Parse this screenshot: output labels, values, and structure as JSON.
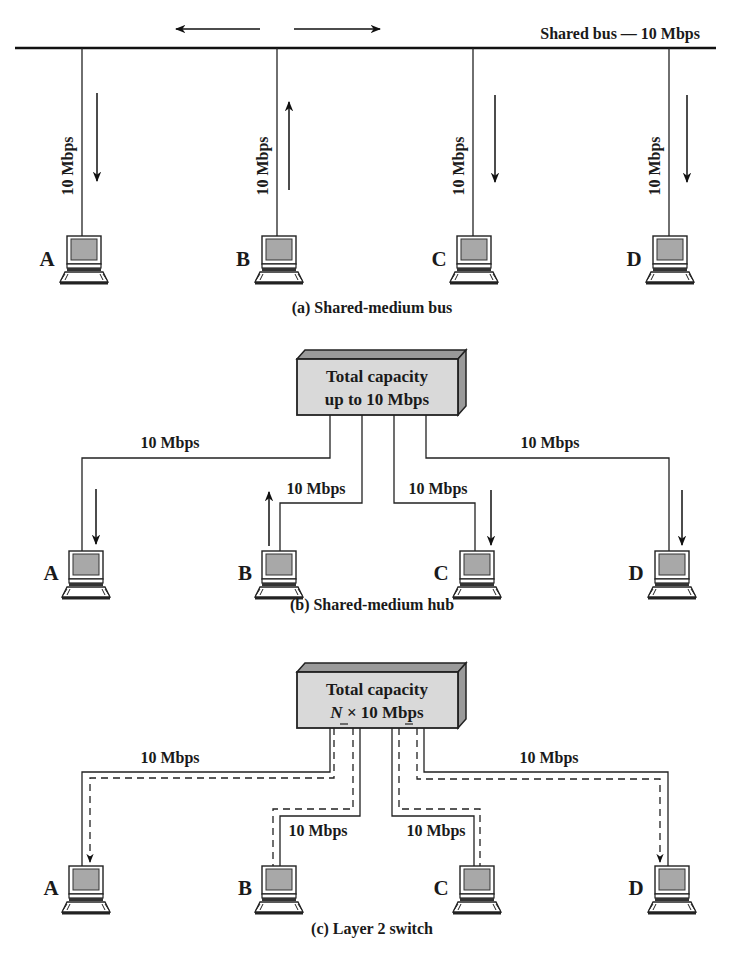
{
  "panels": {
    "a": {
      "caption": "(a) Shared-medium bus",
      "bus_label": "Shared bus — 10 Mbps",
      "link_rate": "10 Mbps",
      "stations": [
        "A",
        "B",
        "C",
        "D"
      ]
    },
    "b": {
      "caption": "(b) Shared-medium hub",
      "device_line1": "Total capacity",
      "device_line2": "up to 10 Mbps",
      "link_rate": "10 Mbps",
      "stations": [
        "A",
        "B",
        "C",
        "D"
      ]
    },
    "c": {
      "caption": "(c) Layer 2 switch",
      "device_line1": "Total capacity",
      "device_line2_italic": "N",
      "device_line2_rest": " × 10 Mbps",
      "link_rate": "10 Mbps",
      "stations": [
        "A",
        "B",
        "C",
        "D"
      ]
    }
  },
  "colors": {
    "line": "#222222",
    "device_face": "#d9d9d9",
    "device_top": "#9a9a9a",
    "screen": "#a8a8a8"
  }
}
